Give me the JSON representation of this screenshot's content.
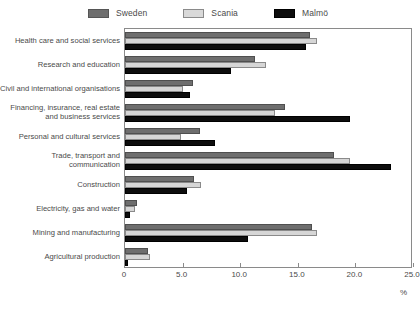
{
  "legend": {
    "items": [
      {
        "label": "Sweden",
        "color": "#6e6e6e",
        "key": "sweden"
      },
      {
        "label": "Scania",
        "color": "#d6d6d6",
        "key": "scania"
      },
      {
        "label": "Malmö",
        "color": "#0d0d0d",
        "key": "malmo"
      }
    ]
  },
  "axis": {
    "unit": "%",
    "ticks": [
      "0",
      "5.0",
      "10.0",
      "15.0",
      "20.0",
      "25.0"
    ]
  },
  "chart_data": {
    "type": "bar",
    "orientation": "horizontal",
    "title": "",
    "xlabel": "%",
    "ylabel": "",
    "xlim": [
      0,
      25
    ],
    "xticks": [
      0,
      5,
      10,
      15,
      20,
      25
    ],
    "grid": false,
    "legend_position": "top-center",
    "categories": [
      "Health care and social services",
      "Research and education",
      "Civil and international organisations",
      "Financing, insurance, real estate and business services",
      "Personal and cultural services",
      "Trade, transport and communication",
      "Construction",
      "Electricity, gas and water",
      "Mining and manufacturing",
      "Agricultural production"
    ],
    "series": [
      {
        "name": "Sweden",
        "color": "#6e6e6e",
        "values": [
          16.1,
          11.3,
          5.9,
          13.9,
          6.5,
          18.1,
          6.0,
          1.0,
          16.2,
          2.0
        ]
      },
      {
        "name": "Scania",
        "color": "#d6d6d6",
        "values": [
          16.7,
          12.2,
          5.0,
          13.0,
          4.9,
          19.5,
          6.6,
          0.9,
          16.7,
          2.2
        ]
      },
      {
        "name": "Malmö",
        "color": "#0d0d0d",
        "values": [
          15.7,
          9.2,
          5.6,
          19.5,
          7.8,
          23.1,
          5.4,
          0.4,
          10.7,
          0.3
        ]
      }
    ]
  }
}
